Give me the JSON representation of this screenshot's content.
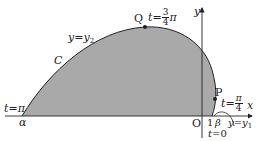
{
  "diagram": {
    "type": "parametric-curve-area",
    "colors": {
      "fill": "#a9a9a9",
      "stroke": "#222222",
      "background": "#ffffff"
    },
    "axes": {
      "x_label": "x",
      "y_label": "y",
      "origin_label": "O",
      "one_label": "1"
    },
    "curve": {
      "name": "C",
      "upper_label_lhs": "y",
      "upper_label_eq": "=",
      "upper_label_rhs": "y",
      "upper_label_sub": "2",
      "lower_label_lhs": "y",
      "lower_label_eq": "=",
      "lower_label_rhs": "y",
      "lower_label_sub": "1"
    },
    "points": {
      "alpha": {
        "label": "α",
        "t_label": "t",
        "t_eq": "=",
        "t_value": "π"
      },
      "Q": {
        "label": "Q",
        "t_label": "t",
        "t_eq": "=",
        "t_num": "3",
        "t_den": "4",
        "t_suffix": "π"
      },
      "P": {
        "label": "P",
        "t_label": "t",
        "t_eq": "=",
        "t_num": "π",
        "t_den": "4"
      },
      "beta": {
        "label": "β",
        "t_label": "t",
        "t_eq": "=",
        "t_value": "0"
      }
    }
  }
}
